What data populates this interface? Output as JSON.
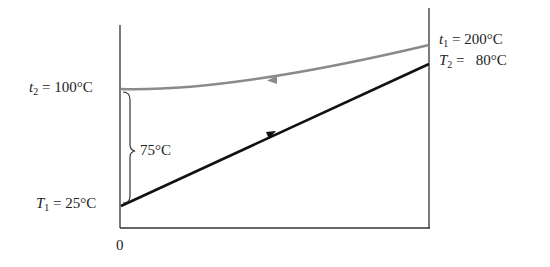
{
  "diagram": {
    "type": "heat-exchanger temperature profile (counterflow)",
    "origin_label": "0",
    "labels": {
      "t2": {
        "symbol": "t",
        "sub": "2",
        "value": " = 100°C"
      },
      "T1": {
        "symbol": "T",
        "sub": "1",
        "value": " = 25°C"
      },
      "t1": {
        "symbol": "t",
        "sub": "1",
        "value": " = 200°C"
      },
      "T2": {
        "symbol": "T",
        "sub": "2",
        "value": " =   80°C"
      },
      "delta": "75°C"
    },
    "colors": {
      "hot_line": "#8a8a8a",
      "cold_line": "#111111",
      "axis": "#333333"
    },
    "lines": [
      {
        "name": "hot-fluid",
        "from": "t1 = 200°C (right)",
        "to": "t2 = 100°C (left)",
        "direction": "left"
      },
      {
        "name": "cold-fluid",
        "from": "T1 = 25°C (left)",
        "to": "T2 = 80°C (right)",
        "direction": "right"
      }
    ]
  }
}
